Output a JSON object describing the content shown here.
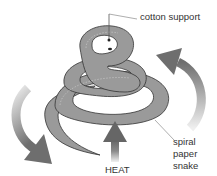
{
  "diagram": {
    "labels": {
      "cotton_support": "cotton support",
      "spiral_line1": "spiral",
      "spiral_line2": "paper",
      "spiral_line3": "snake",
      "heat": "HEAT"
    },
    "colors": {
      "snake_fill": "#9a9a9a",
      "snake_outline": "#333333",
      "arrow_dark": "#6e6e6e",
      "arrow_light": "#e6e6e6",
      "leader_line": "#777777"
    }
  }
}
